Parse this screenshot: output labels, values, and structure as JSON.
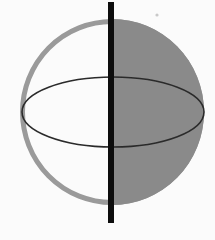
{
  "figure": {
    "title": "Sphere with vertical axis and equatorial ellipse",
    "description": "A shaded sphere whose right hemisphere is filled gray and left hemisphere is white with a gray outline arc; a thick black vertical axis line passes through the center from above the top to below the bottom; a thin dark ellipse represents the equator.",
    "background_color": "#fbfbfb",
    "width": 215,
    "height": 240
  },
  "geometry": {
    "sphere": {
      "name": "sphere",
      "center_x": 112,
      "center_y": 112,
      "radius_x": 92,
      "radius_y": 93,
      "top_y": 20,
      "bottom_y": 206,
      "left_x": 20,
      "right_x": 204
    },
    "shaded_hemisphere": {
      "name": "right-hemisphere-shaded",
      "side": "right",
      "fill_color": "#8a8a8a",
      "split_x": 111
    },
    "unshaded_hemisphere": {
      "name": "left-hemisphere-unshaded",
      "side": "left",
      "fill_color": "#fbfbfb",
      "outline_color": "#9a9a9a",
      "outline_width": 5
    },
    "axis_line": {
      "name": "vertical-axis",
      "x": 111,
      "top_y": 2,
      "bottom_y": 223,
      "width": 6,
      "color": "#111111"
    },
    "equator_ellipse": {
      "name": "equator-ellipse",
      "center_x": 113,
      "center_y": 112,
      "radius_x": 91,
      "radius_y": 35,
      "stroke_color": "#2b2b2b",
      "stroke_width": 1.6
    },
    "speck": {
      "name": "speck-mark",
      "x": 157,
      "y": 15,
      "radius": 1.6,
      "color": "#c9c9c9"
    }
  },
  "labels": {
    "axis": "vertical axis",
    "equator": "equator",
    "shaded": "shaded hemisphere",
    "unshaded": "unshaded hemisphere"
  }
}
